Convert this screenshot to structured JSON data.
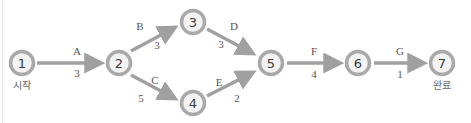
{
  "diagram": {
    "type": "activity-network",
    "colors": {
      "node_ring": "#a9a9a9",
      "node_fill": "#f3f3f3",
      "node_text": "#3a3a3a",
      "arrow": "#a0a0a0",
      "label_text": "#555555"
    },
    "nodes": [
      {
        "id": "1",
        "label": "1",
        "caption": "시작"
      },
      {
        "id": "2",
        "label": "2"
      },
      {
        "id": "3",
        "label": "3"
      },
      {
        "id": "4",
        "label": "4"
      },
      {
        "id": "5",
        "label": "5"
      },
      {
        "id": "6",
        "label": "6"
      },
      {
        "id": "7",
        "label": "7",
        "caption": "완료"
      }
    ],
    "edges": [
      {
        "from": "1",
        "to": "2",
        "activity": "A",
        "duration": "3"
      },
      {
        "from": "2",
        "to": "3",
        "activity": "B",
        "duration": "3"
      },
      {
        "from": "2",
        "to": "4",
        "activity": "C",
        "duration": "5"
      },
      {
        "from": "3",
        "to": "5",
        "activity": "D",
        "duration": "3"
      },
      {
        "from": "4",
        "to": "5",
        "activity": "E",
        "duration": "2"
      },
      {
        "from": "5",
        "to": "6",
        "activity": "F",
        "duration": "4"
      },
      {
        "from": "6",
        "to": "7",
        "activity": "G",
        "duration": "1"
      }
    ]
  }
}
